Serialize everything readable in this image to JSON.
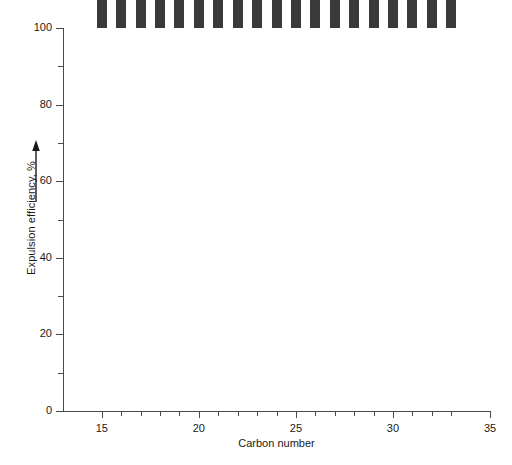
{
  "chart_data": {
    "type": "bar",
    "title": "",
    "xlabel": "Carbon number",
    "ylabel": "Expulsion efficiency, %",
    "ylabel_arrow": "up-arrow",
    "categories": [
      15,
      16,
      17,
      18,
      19,
      20,
      21,
      22,
      23,
      24,
      25,
      26,
      27,
      28,
      29,
      30,
      31,
      32,
      33
    ],
    "values": [
      85.5,
      82.0,
      77.0,
      73.5,
      68.5,
      62.5,
      55.0,
      47.0,
      39.5,
      34.0,
      29.0,
      25.0,
      22.0,
      22.5,
      22.5,
      28.5,
      22.5,
      24.0,
      28.0
    ],
    "xlim": [
      13,
      35
    ],
    "ylim": [
      0,
      100
    ],
    "y_major_ticks": [
      0,
      20,
      40,
      60,
      80,
      100
    ],
    "y_minor_ticks": [
      10,
      30,
      50,
      70,
      90
    ],
    "y_tick_labels": [
      "0",
      "20",
      "40",
      "60",
      "80",
      "100"
    ],
    "x_major_ticks": [
      15,
      20,
      25,
      30,
      35
    ],
    "x_tick_labels": [
      "15",
      "20",
      "25",
      "30",
      "35"
    ],
    "grid": false,
    "legend": null,
    "bar_color": "#3a3a3a",
    "axis_color": "#4a4a4a",
    "background_color": "#ffffff"
  }
}
